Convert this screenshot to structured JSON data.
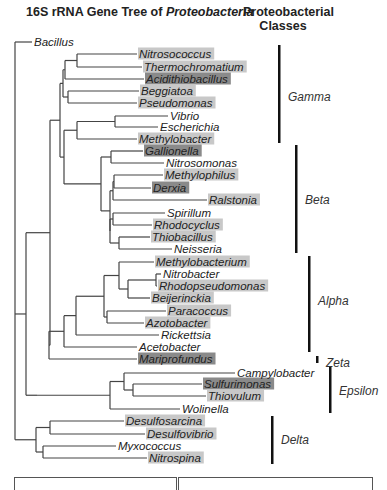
{
  "header": {
    "title_prefix": "16S rRNA Gene Tree of ",
    "title_italic": "Proteobacteria",
    "classes_title_line1": "Proteobacterial",
    "classes_title_line2": "Classes"
  },
  "colors": {
    "line": "#444444",
    "highlight_light": "#c8c8c8",
    "highlight_dark": "#8a8a8a",
    "class_bar": "#111111"
  },
  "taxa": [
    {
      "name": "Bacillus",
      "highlight": "none"
    },
    {
      "name": "Nitrosococcus",
      "highlight": "light"
    },
    {
      "name": "Thermochromatium",
      "highlight": "light"
    },
    {
      "name": "Acidithiobacillus",
      "highlight": "dark"
    },
    {
      "name": "Beggiatoa",
      "highlight": "light"
    },
    {
      "name": "Pseudomonas",
      "highlight": "light"
    },
    {
      "name": "Vibrio",
      "highlight": "none"
    },
    {
      "name": "Escherichia",
      "highlight": "none"
    },
    {
      "name": "Methylobacter",
      "highlight": "light"
    },
    {
      "name": "Gallionella",
      "highlight": "dark"
    },
    {
      "name": "Nitrosomonas",
      "highlight": "none"
    },
    {
      "name": "Methylophilus",
      "highlight": "light"
    },
    {
      "name": "Derxia",
      "highlight": "dark"
    },
    {
      "name": "Ralstonia",
      "highlight": "light"
    },
    {
      "name": "Spirillum",
      "highlight": "none"
    },
    {
      "name": "Rhodocyclus",
      "highlight": "light"
    },
    {
      "name": "Thiobacillus",
      "highlight": "light"
    },
    {
      "name": "Neisseria",
      "highlight": "none"
    },
    {
      "name": "Methylobacterium",
      "highlight": "light"
    },
    {
      "name": "Nitrobacter",
      "highlight": "none"
    },
    {
      "name": "Rhodopseudomonas",
      "highlight": "light"
    },
    {
      "name": "Beijerinckia",
      "highlight": "light"
    },
    {
      "name": "Paracoccus",
      "highlight": "light"
    },
    {
      "name": "Azotobacter",
      "highlight": "light"
    },
    {
      "name": "Rickettsia",
      "highlight": "none"
    },
    {
      "name": "Acetobacter",
      "highlight": "none"
    },
    {
      "name": "Mariprofundus",
      "highlight": "dark"
    },
    {
      "name": "Campylobacter",
      "highlight": "none"
    },
    {
      "name": "Sulfurimonas",
      "highlight": "dark"
    },
    {
      "name": "Thiovulum",
      "highlight": "light"
    },
    {
      "name": "Wolinella",
      "highlight": "none"
    },
    {
      "name": "Desulfosarcina",
      "highlight": "light"
    },
    {
      "name": "Desulfovibrio",
      "highlight": "light"
    },
    {
      "name": "Myxococcus",
      "highlight": "none"
    },
    {
      "name": "Nitrospina",
      "highlight": "light"
    }
  ],
  "classes": [
    {
      "name": "Gamma"
    },
    {
      "name": "Beta"
    },
    {
      "name": "Alpha"
    },
    {
      "name": "Zeta"
    },
    {
      "name": "Epsilon"
    },
    {
      "name": "Delta"
    }
  ]
}
